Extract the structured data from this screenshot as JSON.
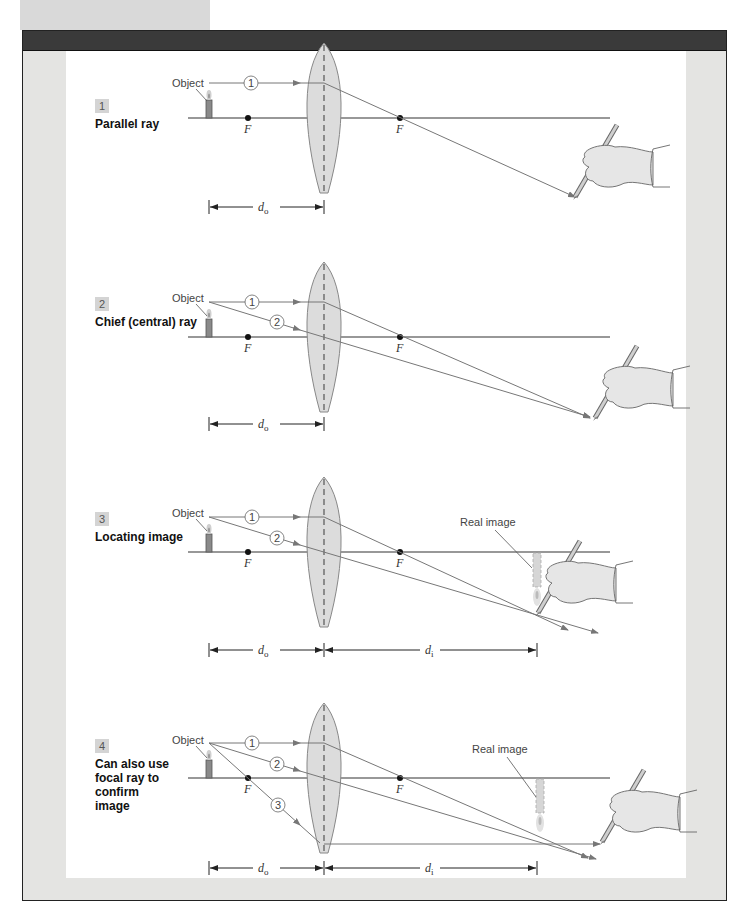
{
  "figure": {
    "colors": {
      "frame_bg": "#e4e4e2",
      "header_bar": "#3a3a3a",
      "lens_fill": "#dcdcdc",
      "ray": "#777777",
      "axis": "#333333",
      "badge_bg": "#d4d4d4"
    },
    "labels": {
      "object": "Object",
      "focal_point": "F",
      "real_image": "Real image",
      "object_distance": "d",
      "object_distance_sub": "o",
      "image_distance": "d",
      "image_distance_sub": "i"
    },
    "steps": [
      {
        "number": "1",
        "title": "Parallel ray",
        "rays": [
          "1"
        ]
      },
      {
        "number": "2",
        "title": "Chief (central) ray",
        "rays": [
          "1",
          "2"
        ]
      },
      {
        "number": "3",
        "title": "Locating image",
        "rays": [
          "1",
          "2"
        ]
      },
      {
        "number": "4",
        "title": "Can also use focal ray to confirm image",
        "rays": [
          "1",
          "2",
          "3"
        ]
      }
    ],
    "ray_labels": [
      "1",
      "2",
      "3"
    ]
  }
}
